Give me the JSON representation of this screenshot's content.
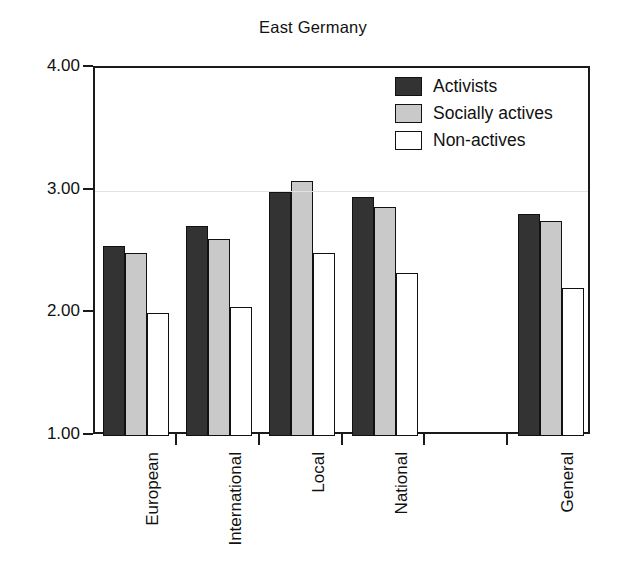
{
  "chart_data": {
    "type": "bar",
    "title": "East Germany",
    "xlabel": "",
    "ylabel": "",
    "ylim": [
      1.0,
      4.0
    ],
    "yticks": [
      "1.00",
      "2.00",
      "3.00",
      "4.00"
    ],
    "ytick_values": [
      1.0,
      2.0,
      3.0,
      4.0
    ],
    "grid": false,
    "legend_position": "top-right",
    "categories": [
      "European",
      "International",
      "Local",
      "National",
      "",
      "General"
    ],
    "series": [
      {
        "name": "Activists",
        "color": "#333333",
        "values": [
          2.55,
          2.71,
          2.99,
          2.95,
          null,
          2.81
        ]
      },
      {
        "name": "Socially actives",
        "color": "#c9c9c9",
        "values": [
          2.49,
          2.61,
          3.08,
          2.87,
          null,
          2.75
        ]
      },
      {
        "name": "Non-actives",
        "color": "#ffffff",
        "values": [
          2.0,
          2.05,
          2.49,
          2.33,
          null,
          2.21
        ]
      }
    ]
  },
  "legend": {
    "items": [
      {
        "label": "Activists"
      },
      {
        "label": "Socially actives"
      },
      {
        "label": "Non-actives"
      }
    ]
  },
  "axes": {
    "y_tick_labels": [
      "4.00",
      "3.00",
      "2.00",
      "1.00"
    ]
  }
}
